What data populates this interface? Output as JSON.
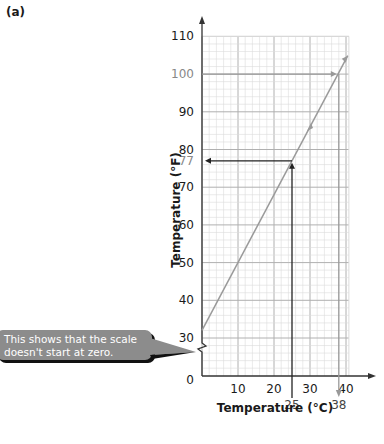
{
  "panel_label": "(a)",
  "callout_text_line1": "This shows that the scale",
  "callout_text_line2": "doesn't start at zero.",
  "colors": {
    "grid_minor": "#dcdcdc",
    "grid_major": "#b0b0b0",
    "axis": "#333333",
    "data_line": "#9a9a9a",
    "guide_arrow_dark": "#222222",
    "guide_arrow_light": "#999999",
    "callout_bg": "#8c8c8c"
  },
  "chart_data": {
    "type": "line",
    "title": "",
    "xlabel": "Temperature (°C)",
    "ylabel": "Temperature (°F)",
    "xlim": [
      0,
      40
    ],
    "ylim": [
      0,
      110
    ],
    "y_axis_break": "between 0 and 30",
    "x_ticks": [
      0,
      10,
      20,
      30,
      40
    ],
    "y_ticks": [
      0,
      30,
      40,
      50,
      60,
      70,
      80,
      90,
      100,
      110
    ],
    "grid": true,
    "series": [
      {
        "name": "Celsius to Fahrenheit conversion",
        "x": [
          0,
          25,
          30,
          38,
          40
        ],
        "y": [
          32,
          77,
          86,
          100,
          104
        ]
      }
    ],
    "annotations": [
      {
        "type": "reading",
        "from_x": 25,
        "to_y": 77,
        "label_x": "25",
        "label_y": "77",
        "color": "dark"
      },
      {
        "type": "reading",
        "from_y": 100,
        "to_x": 38,
        "label_x": "38",
        "label_y": "100",
        "color": "light"
      }
    ]
  }
}
